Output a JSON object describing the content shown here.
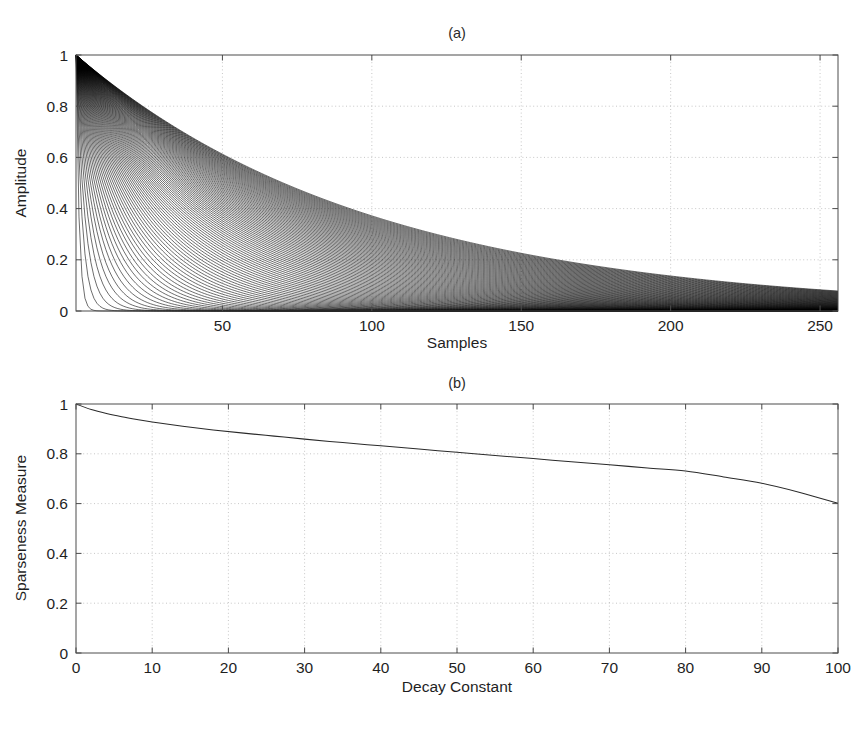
{
  "page": {
    "top_artifact_text": "",
    "background_color": "#ffffff",
    "ink_color": "#000000",
    "grid_color": "#b9b9b9"
  },
  "figure": {
    "panels": [
      {
        "id": "panel-a",
        "title": "(a)",
        "box": {
          "left": 76,
          "top": 55,
          "right": 838,
          "bottom": 311
        }
      },
      {
        "id": "panel-b",
        "title": "(b)",
        "box": {
          "left": 76,
          "top": 404,
          "right": 838,
          "bottom": 653
        }
      }
    ]
  },
  "chart_data": [
    {
      "type": "line",
      "id": "panel-a",
      "title": "(a)",
      "xlabel": "Samples",
      "ylabel": "Amplitude",
      "xlim": [
        1,
        256
      ],
      "ylim": [
        0,
        1
      ],
      "xticks": [
        50,
        100,
        150,
        200,
        250
      ],
      "xticklabels": [
        "50",
        "100",
        "150",
        "200",
        "250"
      ],
      "yticks": [
        0,
        0.2,
        0.4,
        0.6,
        0.8,
        1
      ],
      "yticklabels": [
        "0",
        "0.2",
        "0.4",
        "0.6",
        "0.8",
        "1"
      ],
      "grid": true,
      "legend": "none",
      "description": "Family of exponentially decaying envelopes exp(-n/tau) for decay constants tau = 1..100 over 256 samples; all curves start at amplitude 1.",
      "generator": {
        "formula": "exp(-n/tau)",
        "n_start": 1,
        "n_end": 256,
        "n_points": 256,
        "tau_start": 1,
        "tau_end": 100,
        "tau_step": 1
      }
    },
    {
      "type": "line",
      "id": "panel-b",
      "title": "(b)",
      "xlabel": "Decay Constant",
      "ylabel": "Sparseness Measure",
      "xlim": [
        0,
        100
      ],
      "ylim": [
        0,
        1
      ],
      "xticks": [
        0,
        10,
        20,
        30,
        40,
        50,
        60,
        70,
        80,
        90,
        100
      ],
      "xticklabels": [
        "0",
        "10",
        "20",
        "30",
        "40",
        "50",
        "60",
        "70",
        "80",
        "90",
        "100"
      ],
      "yticks": [
        0,
        0.2,
        0.4,
        0.6,
        0.8,
        1
      ],
      "yticklabels": [
        "0",
        "0.2",
        "0.4",
        "0.6",
        "0.8",
        "1"
      ],
      "grid": true,
      "legend": "none",
      "description": "Sparseness measure decreasing monotonically from 1.0 at decay constant 0 to about 0.60 at decay constant 100.",
      "x": [
        0,
        2,
        4,
        6,
        8,
        10,
        14,
        18,
        22,
        26,
        30,
        35,
        40,
        45,
        50,
        55,
        60,
        65,
        70,
        75,
        80,
        85,
        90,
        95,
        100
      ],
      "values": [
        1.0,
        0.978,
        0.962,
        0.949,
        0.938,
        0.928,
        0.911,
        0.896,
        0.883,
        0.871,
        0.859,
        0.845,
        0.832,
        0.819,
        0.806,
        0.793,
        0.781,
        0.768,
        0.756,
        0.743,
        0.731,
        0.707,
        0.682,
        0.645,
        0.601
      ]
    }
  ]
}
